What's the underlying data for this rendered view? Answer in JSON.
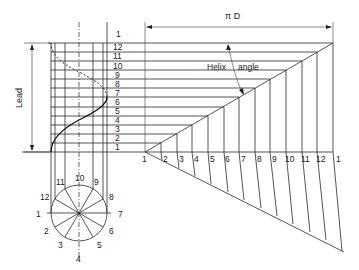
{
  "diagram": {
    "type": "engineering-drawing",
    "labels": {
      "pi_d": "π D",
      "lead": "Lead",
      "helix_angle_1": "Helix",
      "helix_angle_2": "angle"
    },
    "elevation_divisions": [
      "1",
      "2",
      "3",
      "4",
      "5",
      "6",
      "7",
      "8",
      "9",
      "10",
      "11",
      "12",
      "1"
    ],
    "circle_divisions": [
      "1",
      "2",
      "3",
      "4",
      "5",
      "6",
      "7",
      "8",
      "9",
      "10",
      "11",
      "12"
    ],
    "development_divisions": [
      "1",
      "2",
      "3",
      "4",
      "5",
      "6",
      "7",
      "8",
      "9",
      "10",
      "11",
      "12",
      "1"
    ],
    "colors": {
      "line": "#2a2a2a",
      "background": "#ffffff"
    }
  }
}
